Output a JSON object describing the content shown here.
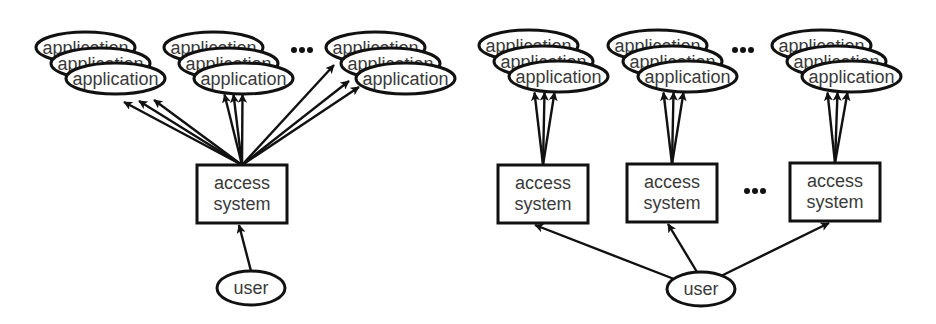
{
  "labels": {
    "application": "application",
    "access_line1": "access",
    "access_line2": "system",
    "user": "user",
    "ellipsis": "..."
  },
  "colors": {
    "stroke": "#111111",
    "text": "#3a3a3a",
    "background": "#ffffff"
  },
  "diagrams": [
    {
      "name": "single-access-system",
      "app_groups": [
        {
          "back": [
            36,
            32
          ],
          "mid": [
            51,
            48
          ],
          "front": [
            66,
            63
          ]
        },
        {
          "back": [
            164,
            32
          ],
          "mid": [
            179,
            48
          ],
          "front": [
            194,
            63
          ]
        },
        {
          "back": [
            326,
            32
          ],
          "mid": [
            341,
            48
          ],
          "front": [
            356,
            63
          ]
        }
      ],
      "group_dots": [
        302,
        50
      ],
      "access_systems": [
        {
          "x": 197,
          "y": 165
        }
      ],
      "user": {
        "cx": 251,
        "cy": 288
      }
    },
    {
      "name": "multiple-access-systems",
      "app_groups": [
        {
          "back": [
            479,
            30
          ],
          "mid": [
            494,
            46
          ],
          "front": [
            509,
            61
          ]
        },
        {
          "back": [
            608,
            30
          ],
          "mid": [
            623,
            46
          ],
          "front": [
            638,
            61
          ]
        },
        {
          "back": [
            772,
            30
          ],
          "mid": [
            787,
            46
          ],
          "front": [
            802,
            61
          ]
        }
      ],
      "group_dots": [
        743,
        50
      ],
      "access_systems": [
        {
          "x": 498,
          "y": 165
        },
        {
          "x": 627,
          "y": 164
        },
        {
          "x": 790,
          "y": 163
        }
      ],
      "box_dots": [
        755,
        191
      ],
      "user": {
        "cx": 701,
        "cy": 289
      }
    }
  ]
}
